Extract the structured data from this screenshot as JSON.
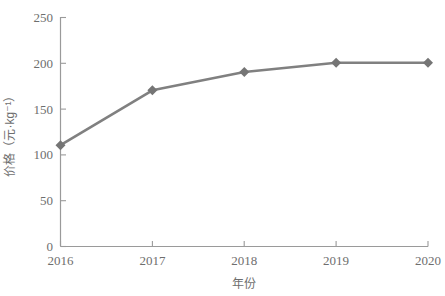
{
  "chart_data": {
    "type": "line",
    "title": "",
    "subtitle": "",
    "xlabel": "年份",
    "ylabel": "价格（元·kg⁻¹）",
    "categories": [
      "2016",
      "2017",
      "2018",
      "2019",
      "2020"
    ],
    "x": [
      2016,
      2017,
      2018,
      2019,
      2020
    ],
    "series": [
      {
        "name": "价格",
        "values": [
          110,
          170,
          190,
          200,
          200
        ],
        "color": "#808080",
        "marker": "diamond"
      }
    ],
    "xlim": [
      2016,
      2020
    ],
    "ylim": [
      0,
      250
    ],
    "ytick_labels": [
      "0",
      "50",
      "100",
      "150",
      "200",
      "250"
    ],
    "ytick_values": [
      0,
      50,
      100,
      150,
      200,
      250
    ],
    "xtick_labels": [
      "2016",
      "2017",
      "2018",
      "2019",
      "2020"
    ],
    "grid": false,
    "legend": false,
    "legend_position": "none",
    "axis_color": "#9a9a9a",
    "text_color": "#6e6e6e",
    "background": "#ffffff",
    "tick_direction": "in",
    "annotations": []
  }
}
